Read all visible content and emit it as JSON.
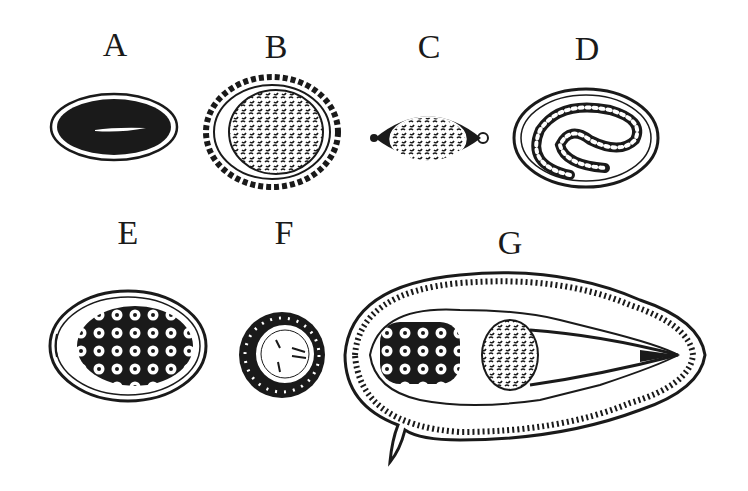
{
  "diagram": {
    "panels": [
      {
        "id": "A",
        "label": "A",
        "shape": "dark oval egg with light central slit"
      },
      {
        "id": "B",
        "label": "B",
        "shape": "round egg with scalloped outer shell and granular interior"
      },
      {
        "id": "C",
        "label": "C",
        "shape": "lemon/barrel-shaped egg with polar plugs"
      },
      {
        "id": "D",
        "label": "D",
        "shape": "oval egg containing coiled larva"
      },
      {
        "id": "E",
        "label": "E",
        "shape": "oval egg with operculum and many cells"
      },
      {
        "id": "F",
        "label": "F",
        "shape": "small round egg with radially striated shell and embryo"
      },
      {
        "id": "G",
        "label": "G",
        "shape": "large oval egg with lateral spine containing miracidium"
      }
    ],
    "colors": {
      "ink": "#1a1a1a",
      "background": "#ffffff"
    }
  }
}
